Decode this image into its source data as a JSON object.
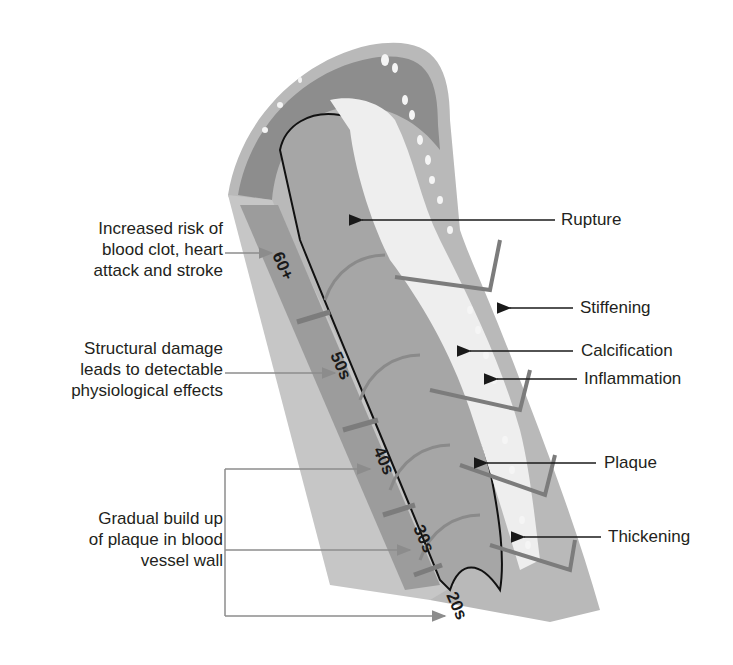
{
  "diagram": {
    "colors": {
      "background": "#ffffff",
      "text": "#231f20",
      "lumen": "#a3a3a3",
      "wall_outer": "#b8b8b8",
      "wall_dark": "#8a8a8a",
      "plaque": "#f0f0f0",
      "pointer_black": "#1a1a1a",
      "pointer_grey": "#8c8c8c"
    },
    "age_segments": [
      {
        "label": "60+"
      },
      {
        "label": "50s"
      },
      {
        "label": "40s"
      },
      {
        "label": "30s"
      },
      {
        "label": "20s"
      }
    ],
    "left_annotations": [
      {
        "lines": [
          "Increased risk of",
          "blood clot, heart",
          "attack and stroke"
        ],
        "points_to": "60+"
      },
      {
        "lines": [
          "Structural damage",
          "leads to detectable",
          "physiological effects"
        ],
        "points_to": "50s"
      },
      {
        "lines": [
          "Gradual build up",
          "of plaque in blood",
          "vessel wall"
        ],
        "points_to": [
          "40s",
          "30s",
          "20s"
        ]
      }
    ],
    "right_annotations": [
      {
        "label": "Rupture"
      },
      {
        "label": "Stiffening"
      },
      {
        "label": "Calcification"
      },
      {
        "label": "Inflammation"
      },
      {
        "label": "Plaque"
      },
      {
        "label": "Thickening"
      }
    ]
  }
}
